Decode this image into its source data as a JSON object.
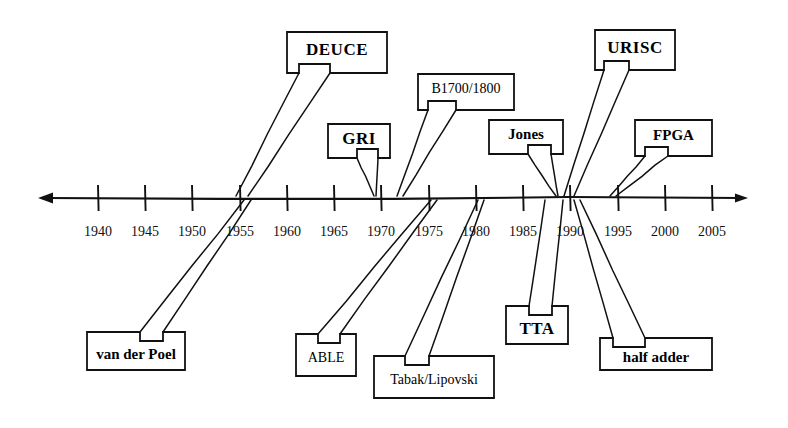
{
  "figure": {
    "type": "timeline",
    "title": "",
    "axis": {
      "orientation": "horizontal",
      "left_arrow": true,
      "right_arrow": true,
      "y": 198,
      "x_start": 38,
      "x_end": 748,
      "tick_count": 14,
      "year_min": 1940,
      "year_max": 2005,
      "year_step": 5
    },
    "year_ticks": [
      {
        "label": "1940",
        "x": 98
      },
      {
        "label": "1945",
        "x": 145
      },
      {
        "label": "1950",
        "x": 192
      },
      {
        "label": "1955",
        "x": 240
      },
      {
        "label": "1960",
        "x": 287
      },
      {
        "label": "1965",
        "x": 334
      },
      {
        "label": "1970",
        "x": 381
      },
      {
        "label": "1975",
        "x": 429
      },
      {
        "label": "1980",
        "x": 476
      },
      {
        "label": "1985",
        "x": 523
      },
      {
        "label": "1990",
        "x": 570
      },
      {
        "label": "1995",
        "x": 618
      },
      {
        "label": "2000",
        "x": 665
      },
      {
        "label": "2005",
        "x": 712
      }
    ],
    "callouts": [
      {
        "id": "deuce",
        "label": "DEUCE",
        "side": "above",
        "box": {
          "x": 287,
          "y": 32,
          "w": 100,
          "h": 41
        },
        "tail_left_x": 299,
        "tail_right_x": 330,
        "targets": [
          236,
          248
        ],
        "text_size": "lg"
      },
      {
        "id": "gri",
        "label": "GRI",
        "side": "above",
        "box": {
          "x": 328,
          "y": 124,
          "w": 62,
          "h": 34
        },
        "tail_left_x": 357,
        "tail_right_x": 378,
        "targets": [
          374
        ],
        "text_size": "lg"
      },
      {
        "id": "b1700-1800",
        "label": "B1700/1800",
        "side": "above",
        "box": {
          "x": 418,
          "y": 74,
          "w": 96,
          "h": 36
        },
        "tail_left_x": 428,
        "tail_right_x": 456,
        "targets": [
          397,
          403
        ],
        "text_size": "sm"
      },
      {
        "id": "jones",
        "label": "Jones",
        "side": "above",
        "box": {
          "x": 489,
          "y": 120,
          "w": 74,
          "h": 34
        },
        "tail_left_x": 528,
        "tail_right_x": 551,
        "targets": [
          556
        ],
        "text_size": "md"
      },
      {
        "id": "urisc",
        "label": "URISC",
        "side": "above",
        "box": {
          "x": 595,
          "y": 30,
          "w": 80,
          "h": 40
        },
        "tail_left_x": 604,
        "tail_right_x": 629,
        "targets": [
          564,
          574
        ],
        "text_size": "lg"
      },
      {
        "id": "fpga",
        "label": "FPGA",
        "side": "above",
        "box": {
          "x": 635,
          "y": 120,
          "w": 77,
          "h": 36
        },
        "tail_left_x": 645,
        "tail_right_x": 668,
        "targets": [
          610,
          616
        ],
        "text_size": "md"
      },
      {
        "id": "van-der-poel",
        "label": "van der Poel",
        "side": "below",
        "box": {
          "x": 87,
          "y": 332,
          "w": 98,
          "h": 38
        },
        "tail_left_x": 140,
        "tail_right_x": 163,
        "targets": [
          244,
          251
        ],
        "text_size": "md"
      },
      {
        "id": "able",
        "label": "ABLE",
        "side": "below",
        "box": {
          "x": 296,
          "y": 334,
          "w": 60,
          "h": 42
        },
        "tail_left_x": 318,
        "tail_right_x": 340,
        "targets": [
          431,
          437
        ],
        "text_size": "sm"
      },
      {
        "id": "tabak-lipovski",
        "label": "Tabak/Lipovski",
        "side": "below",
        "box": {
          "x": 374,
          "y": 356,
          "w": 120,
          "h": 42
        },
        "tail_left_x": 405,
        "tail_right_x": 429,
        "targets": [
          478,
          484
        ],
        "text_size": "sm"
      },
      {
        "id": "tta",
        "label": "TTA",
        "side": "below",
        "box": {
          "x": 506,
          "y": 306,
          "w": 62,
          "h": 38
        },
        "tail_left_x": 529,
        "tail_right_x": 552,
        "targets": [
          545,
          563
        ],
        "text_size": "lg"
      },
      {
        "id": "half-adder",
        "label": "half adder",
        "side": "below",
        "box": {
          "x": 600,
          "y": 338,
          "w": 112,
          "h": 32
        },
        "tail_left_x": 613,
        "tail_right_x": 645,
        "targets": [
          574,
          580
        ],
        "text_size": "md"
      }
    ]
  }
}
